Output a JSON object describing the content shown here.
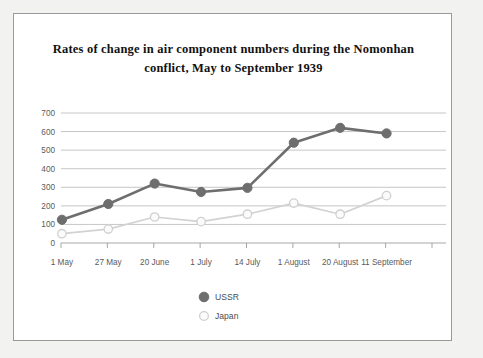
{
  "chart_data": {
    "type": "line",
    "title": "Rates of change in air component numbers during the Nomonhan conflict, May to September 1939",
    "title_line1": "Rates of change in air component numbers during the Nomonhan",
    "title_line2": "conflict, May to September 1939",
    "xlabel": "",
    "ylabel": "",
    "ylim": [
      0,
      700
    ],
    "ytick_step": 100,
    "grid": true,
    "legend_position": "bottom-center",
    "categories": [
      "1 May",
      "27 May",
      "20 June",
      "1 July",
      "14 July",
      "1 August",
      "20 August",
      "11 September"
    ],
    "yticks": [
      "0",
      "100",
      "200",
      "300",
      "400",
      "500",
      "600",
      "700"
    ],
    "series": [
      {
        "name": "USSR",
        "color": "#6e6e6e",
        "marker": "filled-circle",
        "values": [
          125,
          210,
          320,
          275,
          297,
          540,
          620,
          590
        ]
      },
      {
        "name": "Japan",
        "color": "#d2d2d2",
        "marker": "hollow-circle",
        "values": [
          50,
          75,
          140,
          115,
          155,
          215,
          155,
          255
        ]
      }
    ]
  },
  "legend": {
    "items": [
      {
        "label": "USSR",
        "marker": "filled-circle-icon"
      },
      {
        "label": "Japan",
        "marker": "hollow-circle-icon"
      }
    ]
  },
  "colors": {
    "frame_border": "#9a9a9a",
    "page_background": "#f2f2f0",
    "plot_background": "#ffffff",
    "gridline": "#b8b8b8",
    "ussr": "#6e6e6e",
    "japan": "#d2d2d2",
    "text": "#5a5a5a"
  }
}
